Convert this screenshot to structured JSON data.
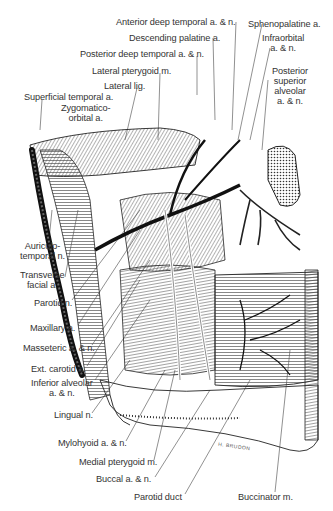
{
  "figure": {
    "type": "anatomical illustration",
    "signature": "H. BRUDON",
    "labels": [
      {
        "id": "anterior-deep-temporal",
        "text": "Anterior deep temporal a. & n.",
        "x": 116,
        "y": 17
      },
      {
        "id": "sphenopalatine",
        "text": "Sphenopalatine a.",
        "x": 248,
        "y": 19
      },
      {
        "id": "descending-palatine",
        "text": "Descending palatine a.",
        "x": 129,
        "y": 33
      },
      {
        "id": "infraorbital",
        "text": "Infraorbital\na. & n.",
        "x": 262,
        "y": 33
      },
      {
        "id": "posterior-deep-temporal",
        "text": "Posterior deep temporal a. & n.",
        "x": 80,
        "y": 49
      },
      {
        "id": "lateral-pterygoid",
        "text": "Lateral pterygoid m.",
        "x": 92,
        "y": 66
      },
      {
        "id": "posterior-superior-alveolar",
        "text": "Posterior\nsuperior\nalveolar\na. & n.",
        "x": 272,
        "y": 66
      },
      {
        "id": "lateral-lig",
        "text": "Lateral lig.",
        "x": 104,
        "y": 81
      },
      {
        "id": "superficial-temporal",
        "text": "Superficial temporal a.",
        "x": 24,
        "y": 92
      },
      {
        "id": "zygomatico-orbital",
        "text": "Zygomatico-\norbital a.",
        "x": 61,
        "y": 103
      },
      {
        "id": "auriculotemporal",
        "text": "Auriculo-\ntemporal n.",
        "x": 20,
        "y": 241
      },
      {
        "id": "transverse-facial",
        "text": "Transverse\nfacial a.",
        "x": 20,
        "y": 270
      },
      {
        "id": "parotid-n",
        "text": "Parotid n.",
        "x": 34,
        "y": 298
      },
      {
        "id": "maxillary",
        "text": "Maxillary a.",
        "x": 30,
        "y": 323
      },
      {
        "id": "masseteric",
        "text": "Masseteric a. & n.",
        "x": 23,
        "y": 343
      },
      {
        "id": "ext-carotid",
        "text": "Ext. carotid a.",
        "x": 31,
        "y": 364
      },
      {
        "id": "inferior-alveolar",
        "text": "Inferior alveolar\na. & n.",
        "x": 31,
        "y": 378
      },
      {
        "id": "lingual",
        "text": "Lingual n.",
        "x": 54,
        "y": 410
      },
      {
        "id": "mylohyoid",
        "text": "Mylohyoid a. & n.",
        "x": 58,
        "y": 438
      },
      {
        "id": "medial-pterygoid",
        "text": "Medial pterygoid m.",
        "x": 79,
        "y": 457
      },
      {
        "id": "buccal",
        "text": "Buccal a. & n.",
        "x": 96,
        "y": 474
      },
      {
        "id": "parotid-duct",
        "text": "Parotid duct",
        "x": 134,
        "y": 492
      },
      {
        "id": "buccinator",
        "text": "Buccinator m.",
        "x": 238,
        "y": 492
      }
    ]
  }
}
